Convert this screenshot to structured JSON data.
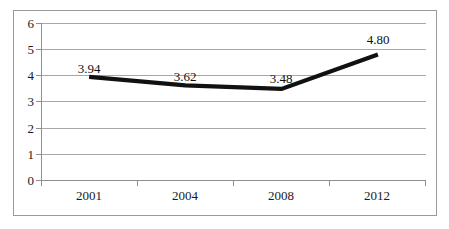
{
  "chart_data": {
    "type": "line",
    "title": "",
    "xlabel": "",
    "ylabel": "",
    "categories": [
      "2001",
      "2004",
      "2008",
      "2012"
    ],
    "values": [
      3.94,
      3.62,
      3.48,
      4.8
    ],
    "point_labels": [
      "3.94",
      "3.62",
      "3.48",
      "4.80"
    ],
    "series": [
      {
        "name": "",
        "values": [
          3.94,
          3.62,
          3.48,
          4.8
        ]
      }
    ],
    "ylim": [
      0,
      6
    ],
    "y_ticks": [
      "0",
      "1",
      "2",
      "3",
      "4",
      "5",
      "6"
    ],
    "grid": true,
    "legend": "none",
    "line_color": "#111111",
    "grid_color": "#a8a8a8",
    "axis_color": "#8f8f8f",
    "border_color": "#9a9a9a"
  }
}
